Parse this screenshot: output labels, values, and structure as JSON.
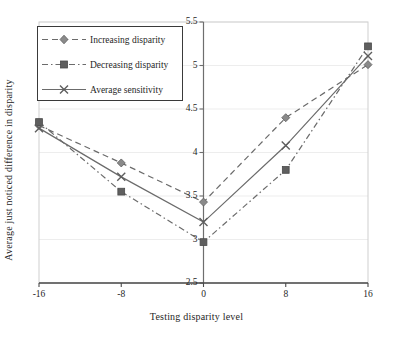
{
  "chart_data": {
    "type": "line",
    "title": "",
    "xlabel": "Testing disparity level",
    "ylabel": "Average just noticed difference in disparity",
    "x": [
      -16,
      -8,
      0,
      8,
      16
    ],
    "categories": [
      "-16",
      "-8",
      "0",
      "8",
      "16"
    ],
    "xtick_labels": [
      "-16",
      "-8",
      "0",
      "8",
      "16"
    ],
    "ytick_labels": [
      "2.5",
      "3",
      "3.5",
      "4",
      "4.5",
      "5",
      "5.5"
    ],
    "ytick_values": [
      2.5,
      3,
      3.5,
      4,
      4.5,
      5,
      5.5
    ],
    "xlim": [
      -16,
      16
    ],
    "ylim": [
      2.5,
      5.5
    ],
    "grid": "horizontal-faint",
    "legend_position": "upper-left-inside",
    "yaxis_position": "center-at-x-zero",
    "series": [
      {
        "name": "Increasing disparity",
        "values": [
          4.31,
          3.88,
          3.43,
          4.4,
          5.01
        ],
        "line_style": "dashed",
        "marker": "diamond",
        "color": "#6b6b6b"
      },
      {
        "name": "Decreasing disparity",
        "values": [
          4.35,
          3.55,
          2.97,
          3.8,
          5.22
        ],
        "line_style": "dash-dot",
        "marker": "square",
        "color": "#6b6b6b"
      },
      {
        "name": "Average sensitivity",
        "values": [
          4.28,
          3.72,
          3.2,
          4.08,
          5.11
        ],
        "line_style": "solid",
        "marker": "x",
        "color": "#6b6b6b"
      }
    ]
  },
  "legend": {
    "items": [
      {
        "label": "Increasing disparity"
      },
      {
        "label": "Decreasing disparity"
      },
      {
        "label": "Average sensitivity"
      }
    ]
  },
  "axes": {
    "x_title": "Testing disparity level",
    "y_title": "Average just noticed difference in disparity"
  }
}
